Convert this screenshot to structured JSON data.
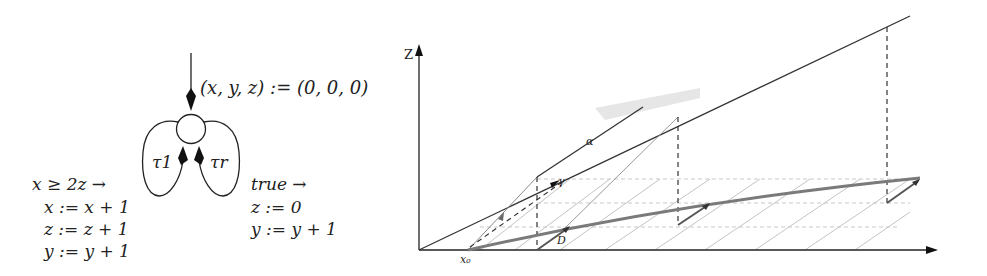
{
  "left_diagram": {
    "init_label": "(x, y, z) := (0, 0, 0)",
    "transitions": [
      {
        "name": "τ1",
        "guard": "x ≥ 2z →",
        "updates": [
          "x := x + 1",
          "z := z + 1",
          "y := y + 1"
        ]
      },
      {
        "name": "τr",
        "guard": "true →",
        "updates": [
          "z := 0",
          "y := y + 1"
        ]
      }
    ]
  },
  "right_diagram": {
    "z_axis_label": "Z",
    "x0_label": "x₀",
    "alpha_label": "α",
    "gamma_label": "γ",
    "d_label": "D",
    "colors": {
      "axis": "#222222",
      "thick_curve": "#7a7a7a",
      "hatch": "#bdbdbd",
      "shade": "#d9d9d9"
    }
  }
}
